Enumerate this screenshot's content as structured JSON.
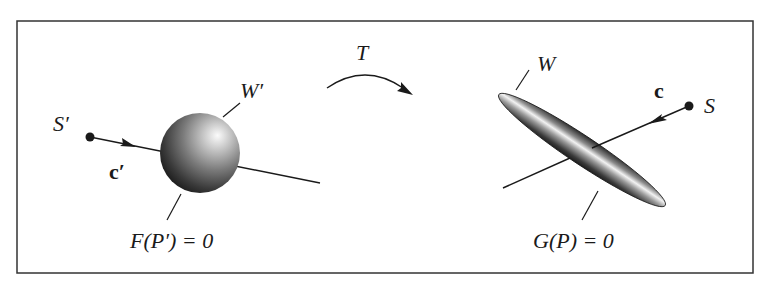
{
  "figure": {
    "left": {
      "source_label": "S′",
      "direction_label": "c′",
      "surface_label": "W′",
      "equation": "F(P′) = 0",
      "shape": "sphere"
    },
    "transform": {
      "label": "T"
    },
    "right": {
      "source_label": "S",
      "direction_label": "c",
      "surface_label": "W",
      "equation": "G(P) = 0",
      "shape": "ellipsoid"
    }
  },
  "colors": {
    "frame": "#333333",
    "ink": "#1a1a1a",
    "shape_dark": "#2a2a2a",
    "shape_highlight": "#f4f4f4"
  }
}
